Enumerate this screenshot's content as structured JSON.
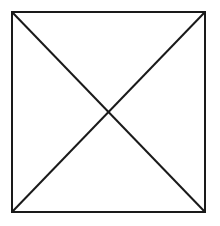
{
  "diagram": {
    "background": "#ffffff",
    "stroke_color": "#1a1a1a",
    "stroke_width": 2,
    "square": {
      "x1": 12,
      "y1": 12,
      "x2": 205,
      "y2": 212
    },
    "diagonals": [
      {
        "name": "diagonal-top-left-to-bottom-right",
        "x1": 12,
        "y1": 12,
        "x2": 205,
        "y2": 212
      },
      {
        "name": "diagonal-top-right-to-bottom-left",
        "x1": 205,
        "y1": 12,
        "x2": 12,
        "y2": 212
      }
    ]
  }
}
